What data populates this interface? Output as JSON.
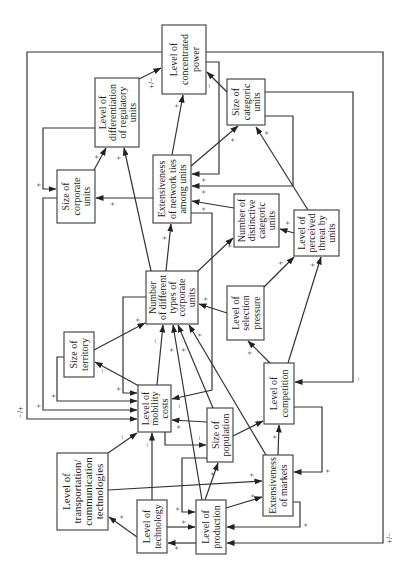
{
  "diagram": {
    "nodes": {
      "concentrated_power": {
        "lines": [
          "Level of",
          "concentrated",
          "power"
        ]
      },
      "diff_regulatory": {
        "lines": [
          "Level of",
          "differentiation",
          "of regulatory",
          "units"
        ]
      },
      "categoric_units": {
        "lines": [
          "Size of",
          "categoric",
          "units"
        ]
      },
      "corporate_units": {
        "lines": [
          "Size of",
          "corporate",
          "units"
        ]
      },
      "network_ties": {
        "lines": [
          "Extensiveness",
          "of network ties",
          "among units"
        ]
      },
      "distinctive_categoric": {
        "lines": [
          "Number of",
          "distinctive",
          "categoric",
          "units"
        ]
      },
      "perceived_threat": {
        "lines": [
          "Level of",
          "perceived",
          "threat by",
          "units"
        ]
      },
      "number_diff_types": {
        "lines": [
          "Number",
          "of different",
          "types of",
          "corporate",
          "units"
        ]
      },
      "territory": {
        "lines": [
          "Size of",
          "territory"
        ]
      },
      "selection_pressure": {
        "lines": [
          "Level of",
          "selection",
          "pressure"
        ]
      },
      "mobility_costs": {
        "lines": [
          "Level of",
          "mobility",
          "costs"
        ]
      },
      "competition": {
        "lines": [
          "Level of",
          "competition"
        ]
      },
      "population": {
        "lines": [
          "Size of",
          "population"
        ]
      },
      "transportation": {
        "lines": [
          "Level of",
          "transportation/",
          "communication",
          "technologies"
        ]
      },
      "markets": {
        "lines": [
          "Extensiveness",
          "of markets"
        ]
      },
      "technology": {
        "lines": [
          "Level of",
          "technology"
        ]
      },
      "production": {
        "lines": [
          "Level of",
          "production"
        ]
      }
    },
    "edges": [
      {
        "from": "concentrated_power",
        "to": "mobility_costs",
        "sign": "−/+"
      },
      {
        "from": "concentrated_power",
        "to": "production",
        "sign": "+/−"
      },
      {
        "from": "concentrated_power",
        "to": "network_ties",
        "sign": "+"
      },
      {
        "from": "diff_regulatory",
        "to": "corporate_units",
        "sign": "+"
      },
      {
        "from": "corporate_units",
        "to": "mobility_costs",
        "sign": "+"
      },
      {
        "from": "territory",
        "to": "mobility_costs",
        "sign": "+"
      },
      {
        "from": "number_diff_types",
        "to": "mobility_costs",
        "sign": "+"
      },
      {
        "from": "mobility_costs",
        "to": "territory",
        "sign": "−"
      },
      {
        "from": "territory",
        "to": "number_diff_types",
        "sign": "+"
      },
      {
        "from": "mobility_costs",
        "to": "number_diff_types",
        "sign": "−"
      },
      {
        "from": "production",
        "to": "number_diff_types",
        "sign": "+"
      },
      {
        "from": "population",
        "to": "number_diff_types",
        "sign": "+"
      },
      {
        "from": "markets",
        "to": "number_diff_types",
        "sign": "+"
      },
      {
        "from": "selection_pressure",
        "to": "number_diff_types",
        "sign": "+"
      },
      {
        "from": "number_diff_types",
        "to": "diff_regulatory",
        "sign": "+"
      },
      {
        "from": "number_diff_types",
        "to": "network_ties",
        "sign": "+"
      },
      {
        "from": "number_diff_types",
        "to": "distinctive_categoric",
        "sign": "+"
      },
      {
        "from": "corporate_units",
        "to": "diff_regulatory",
        "sign": "+"
      },
      {
        "from": "network_ties",
        "to": "corporate_units",
        "sign": "+"
      },
      {
        "from": "network_ties",
        "to": "concentrated_power",
        "sign": "+"
      },
      {
        "from": "diff_regulatory",
        "to": "concentrated_power",
        "sign": "+/−"
      },
      {
        "from": "categoric_units",
        "to": "concentrated_power",
        "sign": "−"
      },
      {
        "from": "network_ties",
        "to": "categoric_units",
        "sign": "+"
      },
      {
        "from": "perceived_threat",
        "to": "categoric_units",
        "sign": "+"
      },
      {
        "from": "categoric_units",
        "to": "network_ties",
        "sign": "+"
      },
      {
        "from": "distinctive_categoric",
        "to": "network_ties",
        "sign": "+"
      },
      {
        "from": "categoric_units",
        "to": "competition",
        "sign": "−"
      },
      {
        "from": "perceived_threat",
        "to": "distinctive_categoric",
        "sign": "+"
      },
      {
        "from": "selection_pressure",
        "to": "perceived_threat",
        "sign": "+"
      },
      {
        "from": "competition",
        "to": "perceived_threat",
        "sign": "+"
      },
      {
        "from": "competition",
        "to": "selection_pressure",
        "sign": "+"
      },
      {
        "from": "network_ties",
        "to": "mobility_costs",
        "sign": "−"
      },
      {
        "from": "population",
        "to": "mobility_costs",
        "sign": "+"
      },
      {
        "from": "mobility_costs",
        "to": "population",
        "sign": "−"
      },
      {
        "from": "population",
        "to": "competition",
        "sign": "+"
      },
      {
        "from": "transportation",
        "to": "mobility_costs",
        "sign": "−"
      },
      {
        "from": "technology",
        "to": "mobility_costs",
        "sign": "−"
      },
      {
        "from": "transportation",
        "to": "markets",
        "sign": "+"
      },
      {
        "from": "technology",
        "to": "transportation",
        "sign": "+"
      },
      {
        "from": "technology",
        "to": "production",
        "sign": "+"
      },
      {
        "from": "production",
        "to": "technology",
        "sign": "+"
      },
      {
        "from": "population",
        "to": "production",
        "sign": "+"
      },
      {
        "from": "production",
        "to": "population",
        "sign": "+"
      },
      {
        "from": "production",
        "to": "markets",
        "sign": "+"
      },
      {
        "from": "markets",
        "to": "competition",
        "sign": "+"
      },
      {
        "from": "competition",
        "to": "markets",
        "sign": "+"
      },
      {
        "from": "markets",
        "to": "production",
        "sign": "+"
      }
    ]
  }
}
